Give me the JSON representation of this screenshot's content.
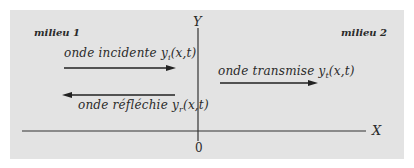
{
  "diagram": {
    "medium_left": "milieu 1",
    "medium_right": "milieu 2",
    "waves": [
      {
        "name": "onde incidente",
        "symbol": "y",
        "subscript": "i",
        "args": "(x,t)",
        "direction": "right"
      },
      {
        "name": "onde réfléchie",
        "symbol": "y",
        "subscript": "r",
        "args": "(x,t)",
        "direction": "left"
      },
      {
        "name": "onde transmise",
        "symbol": "y",
        "subscript": "t",
        "args": "(x,t)",
        "direction": "right"
      }
    ],
    "axes": {
      "x_label": "X",
      "y_label": "Y",
      "origin_label": "0"
    },
    "colors": {
      "background": "#e3e3e3",
      "ink": "#2a2a2a"
    }
  }
}
